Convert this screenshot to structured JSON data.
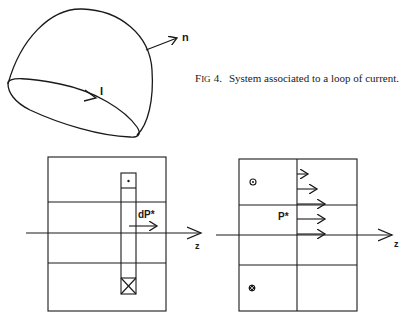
{
  "figure": {
    "caption_prefix_first": "F",
    "caption_prefix_rest": "IG",
    "caption_number": "4.",
    "caption_text": "System associated to a loop of current."
  },
  "top_diagram": {
    "normal_label": "n",
    "current_label": "I"
  },
  "left_panel": {
    "axis_label": "z",
    "moment_label": "dP*",
    "coil_top_symbol": "dot (current out of page)",
    "coil_bottom_symbol": "cross (current into page)"
  },
  "right_panel": {
    "axis_label": "z",
    "moment_label": "P*",
    "top_symbol": "circled dot",
    "bottom_symbol": "circled cross",
    "arrow_count": 5
  }
}
